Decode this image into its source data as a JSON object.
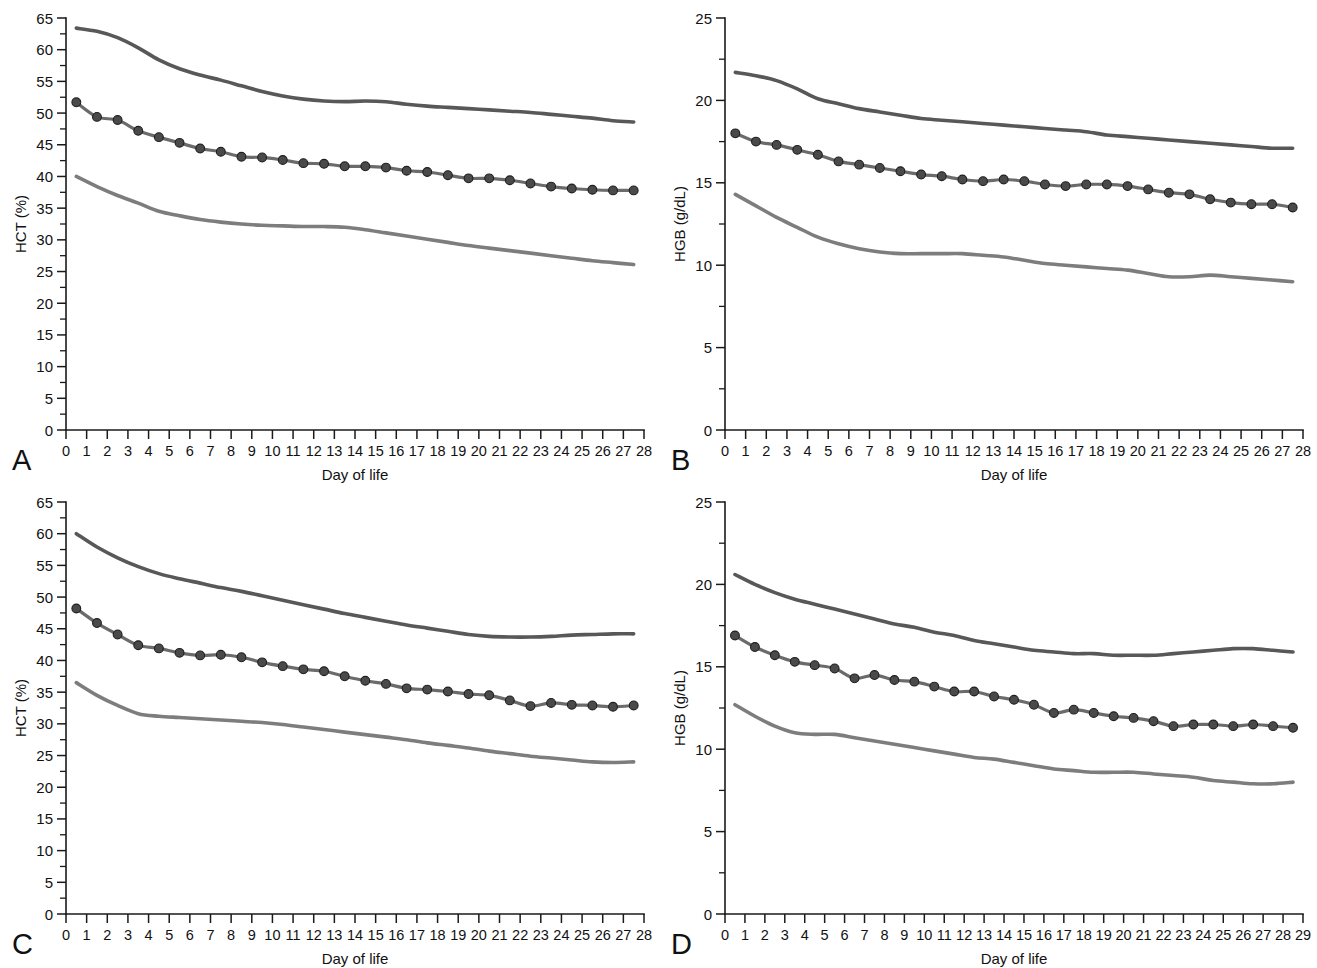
{
  "figure": {
    "background_color": "#ffffff",
    "panel_count": 4
  },
  "styles": {
    "upper_curve_color": "#585858",
    "mid_curve_color": "#6b6b6b",
    "lower_curve_color": "#7d7d7d",
    "marker_fill_color": "#4a4a4a",
    "marker_stroke_color": "#1f1f1f",
    "axis_color": "#1a1a1a",
    "text_color": "#111111"
  },
  "panels": [
    {
      "id": "A",
      "letter": "A",
      "ylabel": "HCT (%)",
      "xlabel": "Day of life"
    },
    {
      "id": "B",
      "letter": "B",
      "ylabel": "HGB (g/dL)",
      "xlabel": "Day of life"
    },
    {
      "id": "C",
      "letter": "C",
      "ylabel": "HCT (%)",
      "xlabel": "Day of life"
    },
    {
      "id": "D",
      "letter": "D",
      "ylabel": "HGB (g/dL)",
      "xlabel": "Day of life"
    }
  ],
  "chart_data": [
    {
      "panel": "A",
      "type": "line",
      "title": "",
      "xlabel": "Day of life",
      "ylabel": "HCT (%)",
      "xlim": [
        0,
        28
      ],
      "ylim": [
        0,
        65
      ],
      "ytick_labels": [
        "0",
        "5",
        "10",
        "15",
        "20",
        "25",
        "30",
        "35",
        "40",
        "45",
        "50",
        "55",
        "60",
        "65"
      ],
      "ytick_values": [
        0,
        5,
        10,
        15,
        20,
        25,
        30,
        35,
        40,
        45,
        50,
        55,
        60,
        65
      ],
      "yminor_step": 2.5,
      "xtick_labels": [
        "0",
        "1",
        "2",
        "3",
        "4",
        "5",
        "6",
        "7",
        "8",
        "9",
        "10",
        "11",
        "12",
        "13",
        "14",
        "15",
        "16",
        "17",
        "18",
        "19",
        "20",
        "21",
        "22",
        "23",
        "24",
        "25",
        "26",
        "27",
        "28"
      ],
      "xtick_values": [
        0,
        1,
        2,
        3,
        4,
        5,
        6,
        7,
        8,
        9,
        10,
        11,
        12,
        13,
        14,
        15,
        16,
        17,
        18,
        19,
        20,
        21,
        22,
        23,
        24,
        25,
        26,
        27,
        28
      ],
      "grid": false,
      "legend": "none",
      "x": [
        0.5,
        1.5,
        2.5,
        3.5,
        4.5,
        5.5,
        6.5,
        7.5,
        8.5,
        9.5,
        10.5,
        11.5,
        12.5,
        13.5,
        14.5,
        15.5,
        16.5,
        17.5,
        18.5,
        19.5,
        20.5,
        21.5,
        22.5,
        23.5,
        24.5,
        25.5,
        26.5,
        27.5
      ],
      "series": [
        {
          "name": "upper",
          "role": "upper-reference-limit",
          "markers": false,
          "values": [
            63.4,
            62.9,
            61.9,
            60.3,
            58.4,
            57.0,
            56.0,
            55.2,
            54.3,
            53.4,
            52.7,
            52.2,
            51.9,
            51.8,
            51.9,
            51.8,
            51.4,
            51.1,
            50.9,
            50.7,
            50.5,
            50.3,
            50.1,
            49.8,
            49.5,
            49.2,
            48.8,
            48.6
          ]
        },
        {
          "name": "mean",
          "role": "mean",
          "markers": true,
          "values": [
            51.7,
            49.4,
            48.9,
            47.2,
            46.2,
            45.3,
            44.4,
            43.9,
            43.1,
            43.0,
            42.6,
            42.1,
            42.0,
            41.6,
            41.6,
            41.4,
            40.9,
            40.7,
            40.2,
            39.7,
            39.7,
            39.4,
            38.9,
            38.4,
            38.1,
            37.9,
            37.8,
            37.8
          ]
        },
        {
          "name": "lower",
          "role": "lower-reference-limit",
          "markers": false,
          "values": [
            40.0,
            38.4,
            37.0,
            35.8,
            34.5,
            33.8,
            33.2,
            32.8,
            32.5,
            32.3,
            32.2,
            32.1,
            32.1,
            32.0,
            31.6,
            31.1,
            30.6,
            30.1,
            29.6,
            29.1,
            28.7,
            28.3,
            27.9,
            27.5,
            27.1,
            26.7,
            26.4,
            26.1
          ]
        }
      ]
    },
    {
      "panel": "B",
      "type": "line",
      "title": "",
      "xlabel": "Day of life",
      "ylabel": "HGB (g/dL)",
      "xlim": [
        0,
        28
      ],
      "ylim": [
        0,
        25
      ],
      "ytick_labels": [
        "0",
        "5",
        "10",
        "15",
        "20",
        "25"
      ],
      "ytick_values": [
        0,
        5,
        10,
        15,
        20,
        25
      ],
      "yminor_step": 2.5,
      "xtick_labels": [
        "0",
        "1",
        "2",
        "3",
        "4",
        "5",
        "6",
        "7",
        "8",
        "9",
        "10",
        "11",
        "12",
        "13",
        "14",
        "15",
        "16",
        "17",
        "18",
        "19",
        "20",
        "21",
        "22",
        "23",
        "24",
        "25",
        "26",
        "27",
        "28"
      ],
      "xtick_values": [
        0,
        1,
        2,
        3,
        4,
        5,
        6,
        7,
        8,
        9,
        10,
        11,
        12,
        13,
        14,
        15,
        16,
        17,
        18,
        19,
        20,
        21,
        22,
        23,
        24,
        25,
        26,
        27,
        28
      ],
      "grid": false,
      "legend": "none",
      "x": [
        0.5,
        1.5,
        2.5,
        3.5,
        4.5,
        5.5,
        6.5,
        7.5,
        8.5,
        9.5,
        10.5,
        11.5,
        12.5,
        13.5,
        14.5,
        15.5,
        16.5,
        17.5,
        18.5,
        19.5,
        20.5,
        21.5,
        22.5,
        23.5,
        24.5,
        25.5,
        26.5,
        27.5
      ],
      "series": [
        {
          "name": "upper",
          "role": "upper-reference-limit",
          "markers": false,
          "values": [
            21.7,
            21.5,
            21.2,
            20.7,
            20.1,
            19.8,
            19.5,
            19.3,
            19.1,
            18.9,
            18.8,
            18.7,
            18.6,
            18.5,
            18.4,
            18.3,
            18.2,
            18.1,
            17.9,
            17.8,
            17.7,
            17.6,
            17.5,
            17.4,
            17.3,
            17.2,
            17.1,
            17.1
          ]
        },
        {
          "name": "mean",
          "role": "mean",
          "markers": true,
          "values": [
            18.0,
            17.5,
            17.3,
            17.0,
            16.7,
            16.3,
            16.1,
            15.9,
            15.7,
            15.5,
            15.4,
            15.2,
            15.1,
            15.2,
            15.1,
            14.9,
            14.8,
            14.9,
            14.9,
            14.8,
            14.6,
            14.4,
            14.3,
            14.0,
            13.8,
            13.7,
            13.7,
            13.5
          ]
        },
        {
          "name": "lower",
          "role": "lower-reference-limit",
          "markers": false,
          "values": [
            14.3,
            13.6,
            12.9,
            12.3,
            11.7,
            11.3,
            11.0,
            10.8,
            10.7,
            10.7,
            10.7,
            10.7,
            10.6,
            10.5,
            10.3,
            10.1,
            10.0,
            9.9,
            9.8,
            9.7,
            9.5,
            9.3,
            9.3,
            9.4,
            9.3,
            9.2,
            9.1,
            9.0
          ]
        }
      ]
    },
    {
      "panel": "C",
      "type": "line",
      "title": "",
      "xlabel": "Day of life",
      "ylabel": "HCT (%)",
      "xlim": [
        0,
        28
      ],
      "ylim": [
        0,
        65
      ],
      "ytick_labels": [
        "0",
        "5",
        "10",
        "15",
        "20",
        "25",
        "30",
        "35",
        "40",
        "45",
        "50",
        "55",
        "60",
        "65"
      ],
      "ytick_values": [
        0,
        5,
        10,
        15,
        20,
        25,
        30,
        35,
        40,
        45,
        50,
        55,
        60,
        65
      ],
      "yminor_step": 2.5,
      "xtick_labels": [
        "0",
        "1",
        "2",
        "3",
        "4",
        "5",
        "6",
        "7",
        "8",
        "9",
        "10",
        "11",
        "12",
        "13",
        "14",
        "15",
        "16",
        "17",
        "18",
        "19",
        "20",
        "21",
        "22",
        "23",
        "24",
        "25",
        "26",
        "27",
        "28"
      ],
      "xtick_values": [
        0,
        1,
        2,
        3,
        4,
        5,
        6,
        7,
        8,
        9,
        10,
        11,
        12,
        13,
        14,
        15,
        16,
        17,
        18,
        19,
        20,
        21,
        22,
        23,
        24,
        25,
        26,
        27,
        28
      ],
      "grid": false,
      "legend": "none",
      "x": [
        0.5,
        1.5,
        2.5,
        3.5,
        4.5,
        5.5,
        6.5,
        7.5,
        8.5,
        9.5,
        10.5,
        11.5,
        12.5,
        13.5,
        14.5,
        15.5,
        16.5,
        17.5,
        18.5,
        19.5,
        20.5,
        21.5,
        22.5,
        23.5,
        24.5,
        25.5,
        26.5,
        27.5
      ],
      "series": [
        {
          "name": "upper",
          "role": "upper-reference-limit",
          "markers": false,
          "values": [
            60.0,
            57.9,
            56.2,
            54.8,
            53.7,
            52.9,
            52.2,
            51.5,
            50.9,
            50.2,
            49.5,
            48.8,
            48.1,
            47.4,
            46.8,
            46.2,
            45.6,
            45.1,
            44.6,
            44.1,
            43.8,
            43.7,
            43.7,
            43.8,
            44.0,
            44.1,
            44.2,
            44.2
          ]
        },
        {
          "name": "mean",
          "role": "mean",
          "markers": true,
          "values": [
            48.2,
            45.9,
            44.1,
            42.4,
            41.9,
            41.2,
            40.8,
            40.9,
            40.5,
            39.7,
            39.1,
            38.6,
            38.3,
            37.5,
            36.8,
            36.3,
            35.6,
            35.4,
            35.1,
            34.7,
            34.5,
            33.7,
            32.8,
            33.3,
            33.0,
            32.9,
            32.7,
            32.9
          ]
        },
        {
          "name": "lower",
          "role": "lower-reference-limit",
          "markers": false,
          "values": [
            36.5,
            34.5,
            32.9,
            31.6,
            31.2,
            31.0,
            30.8,
            30.6,
            30.4,
            30.2,
            29.9,
            29.5,
            29.1,
            28.7,
            28.3,
            27.9,
            27.5,
            27.0,
            26.6,
            26.2,
            25.7,
            25.3,
            24.9,
            24.6,
            24.3,
            24.0,
            23.9,
            24.0
          ]
        }
      ]
    },
    {
      "panel": "D",
      "type": "line",
      "title": "",
      "xlabel": "Day of life",
      "ylabel": "HGB (g/dL)",
      "xlim": [
        0,
        29
      ],
      "ylim": [
        0,
        25
      ],
      "ytick_labels": [
        "0",
        "5",
        "10",
        "15",
        "20",
        "25"
      ],
      "ytick_values": [
        0,
        5,
        10,
        15,
        20,
        25
      ],
      "yminor_step": 2.5,
      "xtick_labels": [
        "0",
        "1",
        "2",
        "3",
        "4",
        "5",
        "6",
        "7",
        "8",
        "9",
        "10",
        "11",
        "12",
        "13",
        "14",
        "15",
        "16",
        "17",
        "18",
        "19",
        "20",
        "21",
        "22",
        "23",
        "24",
        "25",
        "26",
        "27",
        "28",
        "29"
      ],
      "xtick_values": [
        0,
        1,
        2,
        3,
        4,
        5,
        6,
        7,
        8,
        9,
        10,
        11,
        12,
        13,
        14,
        15,
        16,
        17,
        18,
        19,
        20,
        21,
        22,
        23,
        24,
        25,
        26,
        27,
        28,
        29
      ],
      "grid": false,
      "legend": "none",
      "x": [
        0.5,
        1.5,
        2.5,
        3.5,
        4.5,
        5.5,
        6.5,
        7.5,
        8.5,
        9.5,
        10.5,
        11.5,
        12.5,
        13.5,
        14.5,
        15.5,
        16.5,
        17.5,
        18.5,
        19.5,
        20.5,
        21.5,
        22.5,
        23.5,
        24.5,
        25.5,
        26.5,
        27.5,
        28.5
      ],
      "series": [
        {
          "name": "upper",
          "role": "upper-reference-limit",
          "markers": false,
          "values": [
            20.6,
            20.0,
            19.5,
            19.1,
            18.8,
            18.5,
            18.2,
            17.9,
            17.6,
            17.4,
            17.1,
            16.9,
            16.6,
            16.4,
            16.2,
            16.0,
            15.9,
            15.8,
            15.8,
            15.7,
            15.7,
            15.7,
            15.8,
            15.9,
            16.0,
            16.1,
            16.1,
            16.0,
            15.9
          ]
        },
        {
          "name": "mean",
          "role": "mean",
          "markers": true,
          "values": [
            16.9,
            16.2,
            15.7,
            15.3,
            15.1,
            14.9,
            14.3,
            14.5,
            14.2,
            14.1,
            13.8,
            13.5,
            13.5,
            13.2,
            13.0,
            12.7,
            12.2,
            12.4,
            12.2,
            12.0,
            11.9,
            11.7,
            11.4,
            11.5,
            11.5,
            11.4,
            11.5,
            11.4,
            11.3
          ]
        },
        {
          "name": "lower",
          "role": "lower-reference-limit",
          "markers": false,
          "values": [
            12.7,
            12.0,
            11.4,
            11.0,
            10.9,
            10.9,
            10.7,
            10.5,
            10.3,
            10.1,
            9.9,
            9.7,
            9.5,
            9.4,
            9.2,
            9.0,
            8.8,
            8.7,
            8.6,
            8.6,
            8.6,
            8.5,
            8.4,
            8.3,
            8.1,
            8.0,
            7.9,
            7.9,
            8.0
          ]
        }
      ]
    }
  ]
}
